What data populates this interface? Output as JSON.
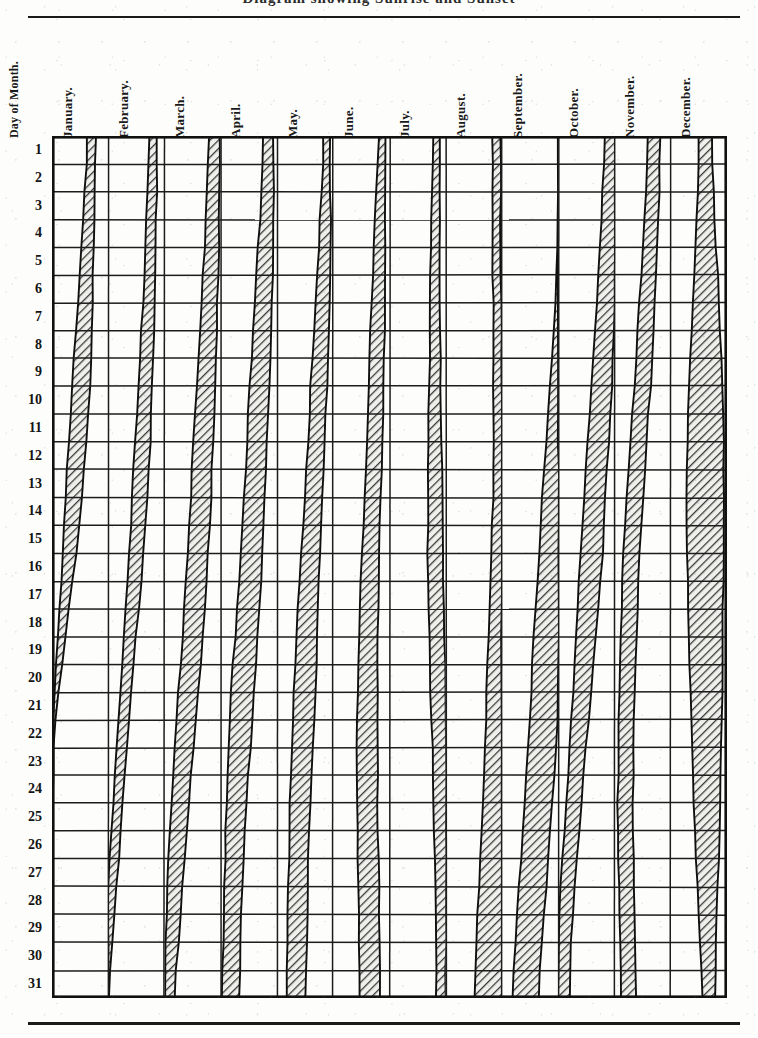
{
  "title": "Diagram showing Sunrise and Sunset",
  "axis": {
    "row_header": "Day of Month.",
    "row_labels": [
      "1",
      "2",
      "3",
      "4",
      "5",
      "6",
      "7",
      "8",
      "9",
      "10",
      "11",
      "12",
      "13",
      "14",
      "15",
      "16",
      "17",
      "18",
      "19",
      "20",
      "21",
      "22",
      "23",
      "24",
      "25",
      "26",
      "27",
      "28",
      "29",
      "30",
      "31"
    ]
  },
  "colors": {
    "ink": "#111111",
    "grid": "#1c1c1c",
    "band_fill": "#8d8d8d",
    "paper": "#fdfdfb"
  },
  "chart_data": {
    "type": "area",
    "title": "Diagram showing Sunrise and Sunset",
    "xlabel": "",
    "ylabel": "Day of Month.",
    "grid": true,
    "legend": "none",
    "categories": [
      "January.",
      "February.",
      "March.",
      "April.",
      "May.",
      "June.",
      "July.",
      "August.",
      "September.",
      "October.",
      "November.",
      "December."
    ],
    "x": [
      1,
      2,
      3,
      4,
      5,
      6,
      7,
      8,
      9,
      10,
      11,
      12,
      13,
      14,
      15,
      16,
      17,
      18,
      19,
      20,
      21,
      22,
      23,
      24,
      25,
      26,
      27,
      28,
      29,
      30,
      31
    ],
    "xlim": [
      1,
      31
    ],
    "ylim": [
      0,
      1
    ],
    "series": [
      {
        "name": "January.",
        "left_edge": [
          0.62,
          0.59,
          0.56,
          0.53,
          0.5,
          0.47,
          0.44,
          0.41,
          0.38,
          0.35,
          0.32,
          0.29,
          0.26,
          0.23,
          0.2,
          0.17,
          0.14,
          0.11,
          0.08,
          0.05,
          0.02,
          0.0,
          0.0,
          0.0,
          0.0,
          0.0,
          0.0,
          0.0,
          0.0,
          0.0,
          0.0
        ],
        "right_edge": [
          0.78,
          0.77,
          0.76,
          0.75,
          0.74,
          0.73,
          0.72,
          0.7,
          0.68,
          0.65,
          0.62,
          0.58,
          0.54,
          0.5,
          0.45,
          0.4,
          0.34,
          0.28,
          0.22,
          0.16,
          0.1,
          0.05,
          0.02,
          0.0,
          0.0,
          0.0,
          0.0,
          0.0,
          0.0,
          0.0,
          0.0
        ]
      },
      {
        "name": "February.",
        "left_edge": [
          0.72,
          0.7,
          0.68,
          0.66,
          0.64,
          0.62,
          0.6,
          0.58,
          0.56,
          0.53,
          0.5,
          0.47,
          0.44,
          0.41,
          0.38,
          0.35,
          0.32,
          0.29,
          0.26,
          0.23,
          0.2,
          0.17,
          0.14,
          0.11,
          0.08,
          0.05,
          0.02,
          0.0,
          0.0,
          0.0,
          0.0
        ],
        "right_edge": [
          0.86,
          0.86,
          0.86,
          0.85,
          0.85,
          0.84,
          0.83,
          0.82,
          0.8,
          0.78,
          0.76,
          0.73,
          0.7,
          0.67,
          0.64,
          0.6,
          0.56,
          0.52,
          0.48,
          0.44,
          0.4,
          0.36,
          0.32,
          0.28,
          0.24,
          0.2,
          0.16,
          0.12,
          0.08,
          0.04,
          0.0
        ]
      },
      {
        "name": "March.",
        "left_edge": [
          0.78,
          0.76,
          0.74,
          0.72,
          0.7,
          0.68,
          0.66,
          0.63,
          0.6,
          0.57,
          0.54,
          0.51,
          0.48,
          0.45,
          0.42,
          0.39,
          0.36,
          0.33,
          0.3,
          0.27,
          0.24,
          0.21,
          0.18,
          0.15,
          0.12,
          0.09,
          0.06,
          0.04,
          0.02,
          0.01,
          0.0
        ],
        "right_edge": [
          0.97,
          0.97,
          0.97,
          0.96,
          0.96,
          0.95,
          0.94,
          0.93,
          0.92,
          0.9,
          0.88,
          0.86,
          0.84,
          0.81,
          0.78,
          0.75,
          0.72,
          0.69,
          0.66,
          0.62,
          0.58,
          0.54,
          0.5,
          0.46,
          0.42,
          0.38,
          0.34,
          0.3,
          0.26,
          0.22,
          0.18
        ]
      },
      {
        "name": "April.",
        "left_edge": [
          0.74,
          0.72,
          0.7,
          0.68,
          0.66,
          0.63,
          0.6,
          0.57,
          0.54,
          0.51,
          0.48,
          0.45,
          0.42,
          0.39,
          0.36,
          0.33,
          0.3,
          0.27,
          0.24,
          0.21,
          0.18,
          0.16,
          0.14,
          0.12,
          0.1,
          0.08,
          0.06,
          0.05,
          0.04,
          0.03,
          0.02
        ],
        "right_edge": [
          0.93,
          0.93,
          0.93,
          0.92,
          0.92,
          0.91,
          0.9,
          0.89,
          0.88,
          0.86,
          0.84,
          0.82,
          0.8,
          0.78,
          0.75,
          0.72,
          0.69,
          0.66,
          0.63,
          0.6,
          0.57,
          0.54,
          0.51,
          0.48,
          0.45,
          0.42,
          0.4,
          0.38,
          0.36,
          0.34,
          0.32
        ]
      },
      {
        "name": "May.",
        "left_edge": [
          0.82,
          0.8,
          0.78,
          0.76,
          0.74,
          0.71,
          0.68,
          0.65,
          0.62,
          0.59,
          0.56,
          0.53,
          0.5,
          0.47,
          0.44,
          0.41,
          0.38,
          0.36,
          0.34,
          0.32,
          0.3,
          0.28,
          0.26,
          0.24,
          0.22,
          0.21,
          0.2,
          0.19,
          0.18,
          0.17,
          0.16
        ],
        "right_edge": [
          0.95,
          0.95,
          0.95,
          0.95,
          0.94,
          0.93,
          0.92,
          0.91,
          0.9,
          0.88,
          0.86,
          0.84,
          0.82,
          0.8,
          0.78,
          0.76,
          0.74,
          0.72,
          0.7,
          0.68,
          0.66,
          0.64,
          0.62,
          0.6,
          0.58,
          0.57,
          0.56,
          0.55,
          0.54,
          0.53,
          0.52
        ]
      },
      {
        "name": "June.",
        "left_edge": [
          0.8,
          0.78,
          0.76,
          0.74,
          0.72,
          0.7,
          0.68,
          0.66,
          0.64,
          0.62,
          0.6,
          0.58,
          0.56,
          0.54,
          0.52,
          0.5,
          0.48,
          0.47,
          0.46,
          0.45,
          0.44,
          0.43,
          0.42,
          0.42,
          0.42,
          0.42,
          0.43,
          0.44,
          0.45,
          0.46,
          0.47
        ],
        "right_edge": [
          0.93,
          0.93,
          0.93,
          0.93,
          0.92,
          0.92,
          0.91,
          0.9,
          0.89,
          0.88,
          0.87,
          0.86,
          0.85,
          0.84,
          0.83,
          0.82,
          0.81,
          0.8,
          0.79,
          0.79,
          0.78,
          0.78,
          0.78,
          0.78,
          0.78,
          0.79,
          0.8,
          0.81,
          0.82,
          0.83,
          0.84
        ]
      },
      {
        "name": "July.",
        "left_edge": [
          0.78,
          0.77,
          0.76,
          0.75,
          0.74,
          0.73,
          0.72,
          0.71,
          0.7,
          0.69,
          0.68,
          0.68,
          0.68,
          0.68,
          0.68,
          0.69,
          0.7,
          0.71,
          0.72,
          0.73,
          0.74,
          0.75,
          0.76,
          0.77,
          0.78,
          0.79,
          0.8,
          0.81,
          0.82,
          0.83,
          0.84
        ],
        "right_edge": [
          0.9,
          0.9,
          0.9,
          0.9,
          0.9,
          0.9,
          0.9,
          0.9,
          0.9,
          0.9,
          0.91,
          0.92,
          0.93,
          0.94,
          0.95,
          0.96,
          0.97,
          0.98,
          0.99,
          1.0,
          1.0,
          1.0,
          1.0,
          1.0,
          1.0,
          1.0,
          1.0,
          1.0,
          1.0,
          1.0,
          1.0
        ]
      },
      {
        "name": "August.",
        "left_edge": [
          0.84,
          0.84,
          0.84,
          0.84,
          0.84,
          0.84,
          0.84,
          0.84,
          0.84,
          0.84,
          0.84,
          0.84,
          0.84,
          0.83,
          0.82,
          0.81,
          0.8,
          0.78,
          0.76,
          0.74,
          0.72,
          0.7,
          0.68,
          0.66,
          0.64,
          0.62,
          0.6,
          0.58,
          0.56,
          0.54,
          0.52
        ],
        "right_edge": [
          0.97,
          0.97,
          0.97,
          0.98,
          0.98,
          0.99,
          1.0,
          1.0,
          1.0,
          1.0,
          1.0,
          1.0,
          1.0,
          1.0,
          1.0,
          1.0,
          1.0,
          1.0,
          1.0,
          1.0,
          1.0,
          1.0,
          1.0,
          1.0,
          1.0,
          1.0,
          1.0,
          1.0,
          1.0,
          1.0,
          1.0
        ]
      },
      {
        "name": "September.",
        "left_edge": [
          1.0,
          1.0,
          1.0,
          1.0,
          0.98,
          0.95,
          0.92,
          0.89,
          0.86,
          0.83,
          0.8,
          0.77,
          0.74,
          0.71,
          0.68,
          0.65,
          0.62,
          0.59,
          0.56,
          0.53,
          0.5,
          0.47,
          0.44,
          0.41,
          0.38,
          0.35,
          0.32,
          0.29,
          0.26,
          0.23,
          0.2
        ],
        "right_edge": [
          1.0,
          1.0,
          1.0,
          1.0,
          1.0,
          1.0,
          1.0,
          1.0,
          1.0,
          1.0,
          1.0,
          1.0,
          1.0,
          1.0,
          1.0,
          1.0,
          1.0,
          1.0,
          1.0,
          1.0,
          1.0,
          0.98,
          0.95,
          0.92,
          0.88,
          0.84,
          0.8,
          0.76,
          0.72,
          0.68,
          0.64
        ]
      },
      {
        "name": "October.",
        "left_edge": [
          0.84,
          0.81,
          0.78,
          0.75,
          0.72,
          0.69,
          0.66,
          0.63,
          0.6,
          0.57,
          0.54,
          0.51,
          0.48,
          0.45,
          0.42,
          0.39,
          0.36,
          0.33,
          0.3,
          0.27,
          0.24,
          0.21,
          0.18,
          0.15,
          0.12,
          0.09,
          0.06,
          0.04,
          0.02,
          0.01,
          0.0
        ],
        "right_edge": [
          1.0,
          1.0,
          1.0,
          1.0,
          1.0,
          1.0,
          1.0,
          0.99,
          0.97,
          0.95,
          0.92,
          0.89,
          0.86,
          0.83,
          0.8,
          0.76,
          0.72,
          0.68,
          0.64,
          0.6,
          0.56,
          0.52,
          0.48,
          0.44,
          0.4,
          0.36,
          0.32,
          0.28,
          0.25,
          0.22,
          0.19
        ]
      },
      {
        "name": "November.",
        "left_edge": [
          0.6,
          0.57,
          0.54,
          0.51,
          0.48,
          0.45,
          0.42,
          0.39,
          0.36,
          0.33,
          0.3,
          0.27,
          0.24,
          0.21,
          0.18,
          0.15,
          0.13,
          0.11,
          0.09,
          0.08,
          0.07,
          0.06,
          0.06,
          0.06,
          0.06,
          0.07,
          0.08,
          0.09,
          0.1,
          0.11,
          0.12
        ],
        "right_edge": [
          0.82,
          0.8,
          0.78,
          0.76,
          0.74,
          0.72,
          0.7,
          0.68,
          0.65,
          0.62,
          0.59,
          0.56,
          0.53,
          0.5,
          0.47,
          0.44,
          0.41,
          0.39,
          0.37,
          0.35,
          0.34,
          0.33,
          0.33,
          0.33,
          0.33,
          0.34,
          0.35,
          0.36,
          0.37,
          0.38,
          0.39
        ]
      },
      {
        "name": "December.",
        "left_edge": [
          0.5,
          0.48,
          0.46,
          0.44,
          0.42,
          0.4,
          0.38,
          0.36,
          0.34,
          0.32,
          0.31,
          0.3,
          0.29,
          0.29,
          0.29,
          0.29,
          0.3,
          0.31,
          0.32,
          0.33,
          0.35,
          0.37,
          0.39,
          0.41,
          0.43,
          0.45,
          0.47,
          0.49,
          0.51,
          0.53,
          0.55
        ],
        "right_edge": [
          0.74,
          0.76,
          0.78,
          0.8,
          0.82,
          0.84,
          0.86,
          0.88,
          0.9,
          0.92,
          0.93,
          0.94,
          0.95,
          0.95,
          0.95,
          0.95,
          0.94,
          0.93,
          0.92,
          0.91,
          0.9,
          0.89,
          0.88,
          0.87,
          0.86,
          0.85,
          0.84,
          0.83,
          0.82,
          0.81,
          0.8
        ]
      }
    ]
  }
}
